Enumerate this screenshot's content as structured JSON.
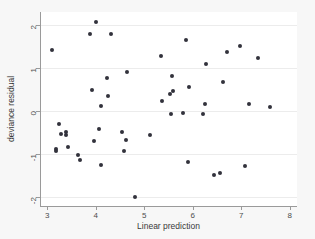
{
  "chart_data": {
    "type": "scatter",
    "title": "",
    "xlabel": "Linear prediction",
    "ylabel": "deviance residual",
    "xlim": [
      2.85,
      8.15
    ],
    "ylim": [
      -2.2,
      2.3
    ],
    "xticks": [
      3,
      4,
      5,
      6,
      7,
      8
    ],
    "yticks": [
      2,
      1,
      0,
      -1,
      -2
    ],
    "xtick_labels": [
      "3",
      "4",
      "5",
      "6",
      "7",
      "8"
    ],
    "ytick_labels": [
      "2",
      "1",
      "0",
      "-1",
      "-2"
    ],
    "grid": "horizontal",
    "legend": "none",
    "marker": {
      "shape": "circle",
      "color": "#32323c",
      "size": 4
    },
    "points": [
      {
        "x": 3.09,
        "y": 1.42
      },
      {
        "x": 3.17,
        "y": -0.88
      },
      {
        "x": 3.18,
        "y": -0.93
      },
      {
        "x": 3.25,
        "y": -0.29
      },
      {
        "x": 3.29,
        "y": -0.52
      },
      {
        "x": 3.38,
        "y": -0.49
      },
      {
        "x": 3.39,
        "y": -0.55
      },
      {
        "x": 3.42,
        "y": -0.84
      },
      {
        "x": 3.64,
        "y": -1.01
      },
      {
        "x": 3.67,
        "y": -1.14
      },
      {
        "x": 3.88,
        "y": 1.79
      },
      {
        "x": 3.93,
        "y": 0.49
      },
      {
        "x": 3.96,
        "y": -0.7
      },
      {
        "x": 4.0,
        "y": 2.07
      },
      {
        "x": 4.06,
        "y": -0.41
      },
      {
        "x": 4.1,
        "y": 0.13
      },
      {
        "x": 4.11,
        "y": -1.25
      },
      {
        "x": 4.23,
        "y": 0.78
      },
      {
        "x": 4.25,
        "y": 0.35
      },
      {
        "x": 4.31,
        "y": 1.79
      },
      {
        "x": 4.55,
        "y": -0.48
      },
      {
        "x": 4.58,
        "y": -0.92
      },
      {
        "x": 4.62,
        "y": -0.68
      },
      {
        "x": 4.65,
        "y": 0.9
      },
      {
        "x": 4.8,
        "y": -1.98
      },
      {
        "x": 5.12,
        "y": -0.56
      },
      {
        "x": 5.34,
        "y": 1.27
      },
      {
        "x": 5.37,
        "y": 0.23
      },
      {
        "x": 5.54,
        "y": 0.39
      },
      {
        "x": 5.56,
        "y": -0.06
      },
      {
        "x": 5.58,
        "y": 0.82
      },
      {
        "x": 5.6,
        "y": 0.47
      },
      {
        "x": 5.79,
        "y": -0.05
      },
      {
        "x": 5.86,
        "y": 1.66
      },
      {
        "x": 5.9,
        "y": -1.17
      },
      {
        "x": 5.92,
        "y": 0.57
      },
      {
        "x": 6.22,
        "y": -0.06
      },
      {
        "x": 6.25,
        "y": 0.16
      },
      {
        "x": 6.28,
        "y": 1.1
      },
      {
        "x": 6.43,
        "y": -1.47
      },
      {
        "x": 6.57,
        "y": -1.43
      },
      {
        "x": 6.62,
        "y": 0.67
      },
      {
        "x": 6.7,
        "y": 1.37
      },
      {
        "x": 6.98,
        "y": 1.52
      },
      {
        "x": 7.08,
        "y": -1.28
      },
      {
        "x": 7.15,
        "y": 0.17
      },
      {
        "x": 7.35,
        "y": 1.24
      },
      {
        "x": 7.6,
        "y": 0.1
      }
    ]
  }
}
